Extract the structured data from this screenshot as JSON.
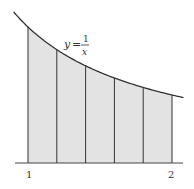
{
  "figure": {
    "function_label": {
      "y": "y",
      "equals": "=",
      "numerator": "1",
      "denominator": "x"
    },
    "x_ticks": [
      "1",
      "2"
    ],
    "x_min": 1,
    "x_max": 2,
    "subintervals": 5,
    "partition_points": [
      1.0,
      1.2,
      1.4,
      1.6,
      1.8,
      2.0
    ],
    "colors": {
      "fill": "#e3e3e3",
      "stroke": "#333333",
      "axis": "#444444"
    }
  }
}
